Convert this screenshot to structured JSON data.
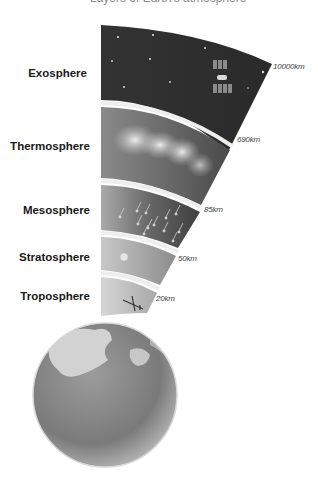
{
  "diagram": {
    "title": "Layers of Earth's atmosphere",
    "layers": [
      {
        "name": "Exosphere",
        "altitude_top": "10000km",
        "feature": "satellite and stars"
      },
      {
        "name": "Thermosphere",
        "altitude_top": "690km",
        "feature": "aurora"
      },
      {
        "name": "Mesosphere",
        "altitude_top": "85km",
        "feature": "meteors"
      },
      {
        "name": "Stratosphere",
        "altitude_top": "50km",
        "feature": "weather balloon"
      },
      {
        "name": "Troposphere",
        "altitude_top": "20km",
        "feature": "airplane"
      }
    ],
    "base": "Earth globe"
  },
  "colors": {
    "exosphere": "#3a3a3a",
    "thermosphere": "#6a6a6a",
    "mesosphere": "#5a5a5a",
    "stratosphere": "#9a9a9a",
    "troposphere": "#b4b4b4",
    "separator": "#e8e8e8",
    "label": "#1a1a1a"
  }
}
